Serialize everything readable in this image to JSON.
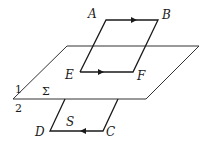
{
  "diagram": {
    "plane": {
      "label": "Σ",
      "side_above": "1",
      "side_below": "2"
    },
    "points": {
      "A": "A",
      "B": "B",
      "C": "C",
      "D": "D",
      "E": "E",
      "F": "F"
    },
    "loop_label": "S",
    "arrows": [
      {
        "segment": "AB",
        "direction": "A to B"
      },
      {
        "segment": "EF",
        "direction": "E to F"
      },
      {
        "segment": "CD",
        "direction": "C to D"
      }
    ],
    "colors": {
      "line": "#1a1a1a",
      "plane": "#333333",
      "background": "#ffffff"
    }
  }
}
